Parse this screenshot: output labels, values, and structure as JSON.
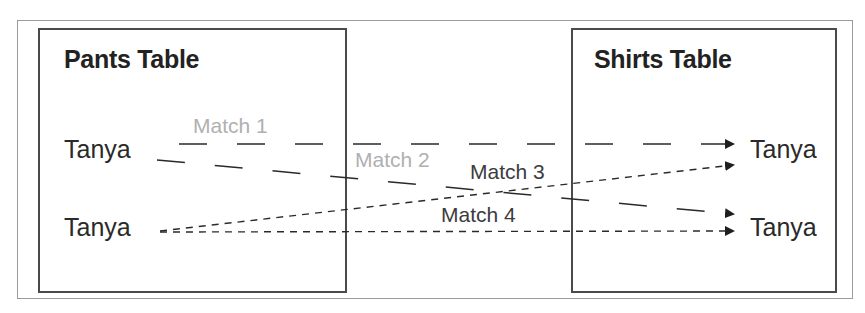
{
  "diagram": {
    "left_table": {
      "title": "Pants Table",
      "rows": [
        {
          "label": "Tanya"
        },
        {
          "label": "Tanya"
        }
      ]
    },
    "right_table": {
      "title": "Shirts Table",
      "rows": [
        {
          "label": "Tanya"
        },
        {
          "label": "Tanya"
        }
      ]
    },
    "matches": [
      {
        "label": "Match 1",
        "from_row": 1,
        "to_row": 1,
        "line_style": "long-dash",
        "label_color": "#b0b0b0"
      },
      {
        "label": "Match 2",
        "from_row": 1,
        "to_row": 2,
        "line_style": "long-dash",
        "label_color": "#b0b0b0"
      },
      {
        "label": "Match 3",
        "from_row": 2,
        "to_row": 1,
        "line_style": "short-dash",
        "label_color": "#3c3c3c"
      },
      {
        "label": "Match 4",
        "from_row": 2,
        "to_row": 2,
        "line_style": "short-dash",
        "label_color": "#3c3c3c"
      }
    ],
    "colors": {
      "box_border": "#4a4a4a",
      "frame_border": "#9a9a9a",
      "line": "#2a2a2a"
    }
  }
}
